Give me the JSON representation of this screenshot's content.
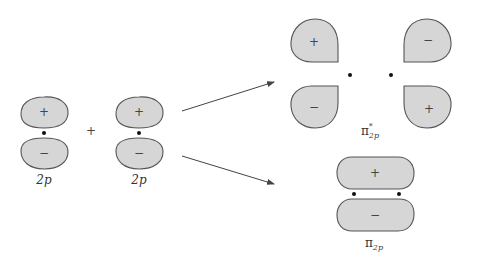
{
  "diagram": {
    "atomic_orbitals": [
      {
        "id": "p1",
        "label": "2p",
        "top_sign": "+",
        "bottom_sign": "−"
      },
      {
        "id": "p2",
        "label": "2p",
        "top_sign": "+",
        "bottom_sign": "−"
      }
    ],
    "combine_symbol": "+",
    "antibonding": {
      "label_main": "π",
      "label_sup": "*",
      "label_sub": "2p",
      "signs": {
        "top_left": "+",
        "top_right": "−",
        "bottom_left": "−",
        "bottom_right": "+"
      }
    },
    "bonding": {
      "label_main": "π",
      "label_sub": "2p",
      "top_sign": "+",
      "bottom_sign": "−"
    },
    "colors": {
      "lobe_fill": "#d6d6d6",
      "lobe_stroke": "#555555",
      "arrow": "#444444"
    }
  }
}
